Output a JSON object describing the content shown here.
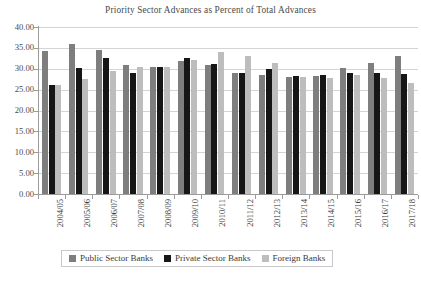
{
  "chart_data": {
    "type": "bar",
    "title": "Priority Sector Advances as Percent of Total Advances",
    "xlabel": "",
    "ylabel": "",
    "ylim": [
      0,
      40
    ],
    "ytick_step": 5,
    "ytick_labels": [
      "40.00",
      "35.00",
      "30.00",
      "25.00",
      "20.00",
      "15.00",
      "10.00",
      "5.00",
      "0.00"
    ],
    "ytick_values": [
      40,
      35,
      30,
      25,
      20,
      15,
      10,
      5,
      0
    ],
    "grid": true,
    "grid_axis": "y",
    "legend_position": "bottom",
    "categories": [
      "2004/05",
      "2005/06",
      "2006/07",
      "2007/08",
      "2008/09",
      "2009/10",
      "2010/11",
      "2011/12",
      "2012/13",
      "2013/14",
      "2014/15",
      "2015/16",
      "2016/17",
      "2017/18"
    ],
    "series": [
      {
        "name": "Public Sector Banks",
        "color": "#7e7e7e",
        "values": [
          34.2,
          36.0,
          34.5,
          31.0,
          30.5,
          31.8,
          31.0,
          29.0,
          28.6,
          28.0,
          28.2,
          30.2,
          31.5,
          33.0
        ]
      },
      {
        "name": "Private Sector Banks",
        "color": "#161616",
        "values": [
          26.0,
          30.3,
          32.5,
          29.0,
          30.4,
          32.5,
          31.2,
          29.0,
          30.0,
          28.3,
          28.6,
          29.0,
          29.0,
          28.8
        ]
      },
      {
        "name": "Foreign Banks",
        "color": "#bdbdbd",
        "values": [
          26.0,
          27.5,
          29.5,
          30.5,
          30.5,
          32.0,
          34.0,
          33.0,
          31.5,
          28.0,
          27.8,
          28.5,
          27.8,
          26.6
        ]
      }
    ]
  },
  "legend": {
    "items": [
      {
        "label": "Public Sector Banks",
        "color": "#7e7e7e",
        "swatch_name": "legend-swatch-public-sector-banks"
      },
      {
        "label": "Private Sector Banks",
        "color": "#161616",
        "swatch_name": "legend-swatch-private-sector-banks"
      },
      {
        "label": "Foreign Banks",
        "color": "#bdbdbd",
        "swatch_name": "legend-swatch-foreign-banks"
      }
    ]
  }
}
